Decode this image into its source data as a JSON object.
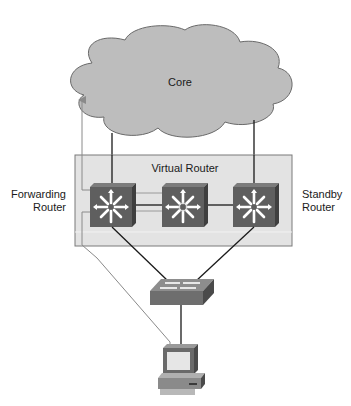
{
  "diagram": {
    "core": {
      "label": "Core",
      "fill": "#bdbdbd"
    },
    "virtual_router": {
      "label": "Virtual Router",
      "fill": "#e3e3e3"
    },
    "forwarding_router": {
      "label_line1": "Forwarding",
      "label_line2": "Router"
    },
    "standby_router": {
      "label_line1": "Standby",
      "label_line2": "Router"
    },
    "nodes": [
      {
        "id": "core",
        "type": "cloud",
        "label": "Core"
      },
      {
        "id": "forwarding-router",
        "type": "layer3-switch",
        "label": "Forwarding Router"
      },
      {
        "id": "virtual-router",
        "type": "layer3-switch",
        "label": "Virtual Router"
      },
      {
        "id": "standby-router",
        "type": "layer3-switch",
        "label": "Standby Router"
      },
      {
        "id": "access-switch",
        "type": "switch",
        "label": ""
      },
      {
        "id": "host-pc",
        "type": "workstation",
        "label": ""
      }
    ],
    "links": [
      {
        "from": "core",
        "to": "forwarding-router"
      },
      {
        "from": "core",
        "to": "standby-router"
      },
      {
        "from": "forwarding-router",
        "to": "virtual-router"
      },
      {
        "from": "virtual-router",
        "to": "standby-router"
      },
      {
        "from": "forwarding-router",
        "to": "access-switch"
      },
      {
        "from": "standby-router",
        "to": "access-switch"
      },
      {
        "from": "access-switch",
        "to": "host-pc"
      }
    ],
    "traffic_path": {
      "from": "host-pc",
      "via": "forwarding-router",
      "to": "core",
      "color": "#8a8a8a"
    },
    "colors": {
      "router_front": "#5f5f5f",
      "router_top": "#7c7c7c",
      "router_side": "#3f3f3f",
      "link": "#1a1a1a",
      "path": "#8a8a8a"
    }
  }
}
